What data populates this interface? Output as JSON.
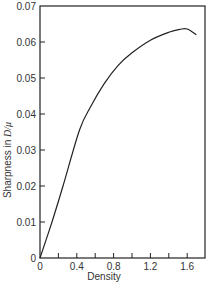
{
  "chart_data": {
    "type": "line",
    "title": "",
    "xlabel": "Density",
    "ylabel": "Sharpness in D/μ",
    "ylabel_prefix": "Sharpness in ",
    "ylabel_italic": "D/μ",
    "xlim": [
      0,
      1.8
    ],
    "ylim": [
      0,
      0.07
    ],
    "grid": false,
    "legend": null,
    "x_ticks": [
      "0",
      "0.4",
      "0.8",
      "1.2",
      "1.6"
    ],
    "x_tick_values": [
      0,
      0.4,
      0.8,
      1.2,
      1.6
    ],
    "x_minor_ticks": [
      0.2,
      0.6,
      1.0,
      1.4
    ],
    "y_ticks": [
      "0",
      "0.01",
      "0.02",
      "0.03",
      "0.04",
      "0.05",
      "0.06",
      "0.07"
    ],
    "y_tick_values": [
      0,
      0.01,
      0.02,
      0.03,
      0.04,
      0.05,
      0.06,
      0.07
    ],
    "series": [
      {
        "name": "Sharpness",
        "x": [
          0,
          0.13,
          0.25,
          0.43,
          0.55,
          0.7,
          0.85,
          1.0,
          1.2,
          1.4,
          1.52,
          1.6,
          1.7
        ],
        "y": [
          0,
          0.01,
          0.02,
          0.0356,
          0.042,
          0.0485,
          0.0535,
          0.057,
          0.0605,
          0.0627,
          0.0635,
          0.0636,
          0.062
        ]
      }
    ]
  }
}
